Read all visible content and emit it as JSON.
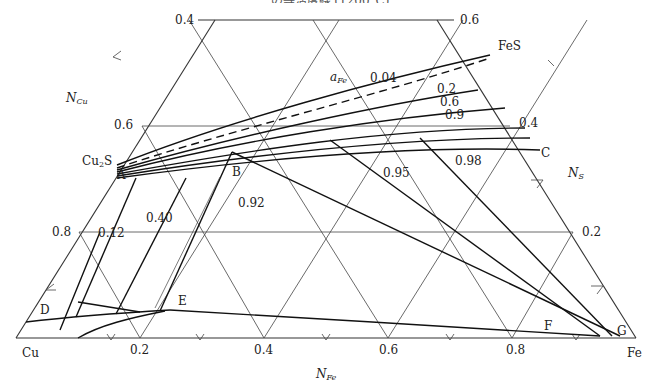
{
  "header": {
    "title_fragment": "…の等活度線 (1200°C)"
  },
  "diagram": {
    "type": "ternary phase diagram",
    "system": "Cu–Fe–S",
    "vertices": {
      "bottom_left": "Cu",
      "bottom_right": "Fe"
    },
    "compounds": [
      "Cu2S",
      "FeS"
    ],
    "axes": {
      "bottom": {
        "label": "N",
        "subscript": "Fe",
        "ticks": [
          "0.2",
          "0.4",
          "0.6",
          "0.8"
        ]
      },
      "left": {
        "label": "N",
        "subscript": "Cu",
        "ticks": [
          "0.4",
          "0.6",
          "0.8"
        ]
      },
      "right": {
        "label": "N",
        "subscript": "S",
        "ticks": [
          "0.6",
          "0.4",
          "0.2"
        ]
      }
    },
    "activity_label": {
      "symbol": "a",
      "subscript": "Fe"
    },
    "iso_activity_values": [
      "0.04",
      "0.2",
      "0.6",
      "0.9",
      "0.12",
      "0.40",
      "0.92",
      "0.95",
      "0.98"
    ],
    "points": [
      "A",
      "B",
      "C",
      "D",
      "E",
      "F",
      "G"
    ]
  },
  "labels": {
    "cu": "Cu",
    "fe": "Fe",
    "cu2s_main": "Cu",
    "cu2s_sub": "2",
    "cu2s_end": "S",
    "fes": "FeS",
    "n": "N",
    "sub_fe": "Fe",
    "sub_cu": "Cu",
    "sub_s": "S",
    "a": "a",
    "t_04": "0.4",
    "t_06": "0.6",
    "t_08": "0.8",
    "t_06r": "0.6",
    "t_04r": "0.4",
    "t_02r": "0.2",
    "b_02": "0.2",
    "b_04": "0.4",
    "b_06": "0.6",
    "b_08": "0.8",
    "v_004": "0.04",
    "v_02": "0.2",
    "v_06": "0.6",
    "v_09": "0.9",
    "v_012": "0.12",
    "v_040": "0.40",
    "v_092": "0.92",
    "v_095": "0.95",
    "v_098": "0.98",
    "pA": "A",
    "pB": "B",
    "pC": "C",
    "pD": "D",
    "pE": "E",
    "pF": "F",
    "pG": "G"
  }
}
